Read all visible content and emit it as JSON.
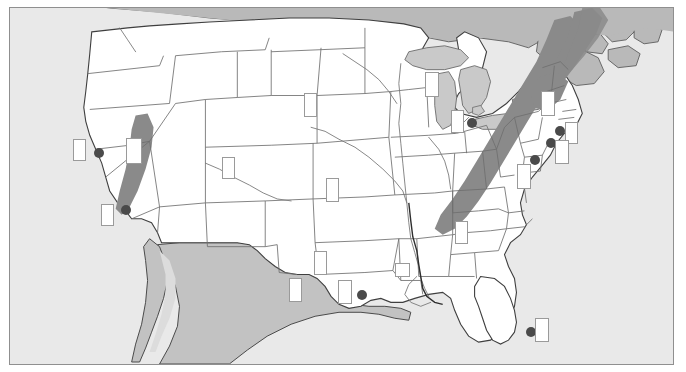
{
  "figure": {
    "type": "thematic-map",
    "region": "Contiguous United States",
    "title": "",
    "frame": {
      "x": 9,
      "y": 7,
      "width": 665,
      "height": 358,
      "border_color": "#8f8f8f"
    }
  },
  "colors": {
    "ocean": "#e9e9e9",
    "background": "#ffffff",
    "land_us": "#ffffff",
    "land_foreign": "#c2c2c2",
    "land_canada": "#b9b9b9",
    "lakes": "#c9c9c9",
    "highland_band": "#8a8a8a",
    "state_border": "#6e6e6e",
    "country_border": "#3a3a3a",
    "river": "#7a7a7a",
    "site_dot": "#4a4a4a",
    "label_box_fill": "#ffffff",
    "label_box_border": "#9a9a9a"
  },
  "legend": {
    "visible": false,
    "entries": []
  },
  "axis_labels": {
    "visible": false
  },
  "shaded_regions": [
    {
      "name": "sierra-nevada-band",
      "label": "",
      "color": "#8a8a8a"
    },
    {
      "name": "appalachian-band",
      "label": "",
      "color": "#8a8a8a"
    },
    {
      "name": "northern-appalachian-band",
      "label": "",
      "color": "#8a8a8a"
    }
  ],
  "site_dots": [
    {
      "name": "site-san-francisco",
      "label": "",
      "x": 93,
      "y": 155,
      "r": 5
    },
    {
      "name": "site-los-angeles",
      "label": "",
      "x": 120,
      "y": 212,
      "r": 5
    },
    {
      "name": "site-houston",
      "label": "",
      "x": 356,
      "y": 297,
      "r": 5
    },
    {
      "name": "site-chicago",
      "label": "",
      "x": 466,
      "y": 125,
      "r": 5
    },
    {
      "name": "site-new-york",
      "label": "",
      "x": 554,
      "y": 133,
      "r": 5
    },
    {
      "name": "site-philadelphia",
      "label": "",
      "x": 545,
      "y": 145,
      "r": 5
    },
    {
      "name": "site-washington-dc",
      "label": "",
      "x": 529,
      "y": 162,
      "r": 5
    },
    {
      "name": "site-miami",
      "label": "",
      "x": 525,
      "y": 334,
      "r": 5
    }
  ],
  "label_boxes": [
    {
      "name": "label-box-california-north",
      "text": "",
      "x": 72,
      "y": 146,
      "w": 13,
      "h": 22
    },
    {
      "name": "label-box-california-south",
      "text": "",
      "x": 100,
      "y": 211,
      "w": 13,
      "h": 22
    },
    {
      "name": "label-box-nevada",
      "text": "",
      "x": 125,
      "y": 145,
      "w": 16,
      "h": 26
    },
    {
      "name": "label-box-colorado",
      "text": "",
      "x": 221,
      "y": 164,
      "w": 13,
      "h": 22
    },
    {
      "name": "label-box-nebraska",
      "text": "",
      "x": 303,
      "y": 100,
      "w": 13,
      "h": 24
    },
    {
      "name": "label-box-kansas",
      "text": "",
      "x": 325,
      "y": 185,
      "w": 13,
      "h": 24
    },
    {
      "name": "label-box-texas-west",
      "text": "",
      "x": 288,
      "y": 285,
      "w": 13,
      "h": 24
    },
    {
      "name": "label-box-texas-central",
      "text": "",
      "x": 313,
      "y": 258,
      "w": 13,
      "h": 24
    },
    {
      "name": "label-box-texas-gulf",
      "text": "",
      "x": 337,
      "y": 287,
      "w": 14,
      "h": 24
    },
    {
      "name": "label-box-louisiana",
      "text": "",
      "x": 394,
      "y": 270,
      "w": 15,
      "h": 14
    },
    {
      "name": "label-box-wisconsin",
      "text": "",
      "x": 424,
      "y": 79,
      "w": 14,
      "h": 25
    },
    {
      "name": "label-box-illinois",
      "text": "",
      "x": 450,
      "y": 117,
      "w": 13,
      "h": 23
    },
    {
      "name": "label-box-tennessee",
      "text": "",
      "x": 454,
      "y": 228,
      "w": 13,
      "h": 23
    },
    {
      "name": "label-box-newyork-north",
      "text": "",
      "x": 540,
      "y": 98,
      "w": 14,
      "h": 25
    },
    {
      "name": "label-box-newengland",
      "text": "",
      "x": 564,
      "y": 129,
      "w": 13,
      "h": 22
    },
    {
      "name": "label-box-mid-atlantic",
      "text": "",
      "x": 554,
      "y": 147,
      "w": 14,
      "h": 24
    },
    {
      "name": "label-box-virginia",
      "text": "",
      "x": 516,
      "y": 171,
      "w": 14,
      "h": 25
    },
    {
      "name": "label-box-florida",
      "text": "",
      "x": 534,
      "y": 325,
      "w": 14,
      "h": 24
    }
  ]
}
